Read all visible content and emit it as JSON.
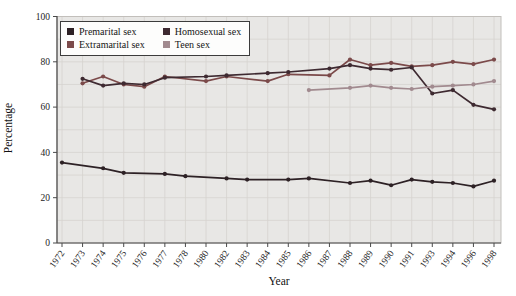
{
  "chart_data": {
    "type": "line",
    "title": "",
    "xlabel": "Year",
    "ylabel": "Percentage",
    "ylim": [
      0,
      100
    ],
    "yticks": [
      0,
      20,
      40,
      60,
      80,
      100
    ],
    "grid": true,
    "legend_position": "top-left",
    "legend_order": [
      0,
      2,
      1,
      3
    ],
    "categories": [
      "1972",
      "1973",
      "1974",
      "1975",
      "1976",
      "1977",
      "1978",
      "1980",
      "1982",
      "1983",
      "1984",
      "1985",
      "1986",
      "1987",
      "1988",
      "1989",
      "1990",
      "1991",
      "1993",
      "1994",
      "1996",
      "1998"
    ],
    "series": [
      {
        "name": "Premarital sex",
        "color": "#2d2125",
        "values": [
          35.5,
          null,
          33,
          31,
          null,
          30.5,
          29.5,
          null,
          28.5,
          28,
          null,
          28,
          28.5,
          null,
          26.5,
          27.5,
          25.5,
          28,
          27,
          26.5,
          25,
          27.5
        ]
      },
      {
        "name": "Extramarital sex",
        "color": "#7b4a4a",
        "values": [
          null,
          70.5,
          73.5,
          70,
          69,
          73.5,
          null,
          71.5,
          73.5,
          null,
          71.5,
          74.5,
          null,
          74,
          81,
          78.5,
          79.5,
          78,
          78.5,
          80,
          79,
          81
        ]
      },
      {
        "name": "Homosexual sex",
        "color": "#3e2a31",
        "values": [
          null,
          72.5,
          69.5,
          70.5,
          70,
          73,
          null,
          73.5,
          74,
          null,
          75,
          75.5,
          null,
          77,
          78.5,
          77,
          76.5,
          77.5,
          66,
          67.5,
          61,
          59
        ]
      },
      {
        "name": "Teen sex",
        "color": "#a18a8f",
        "values": [
          null,
          null,
          null,
          null,
          null,
          null,
          null,
          null,
          null,
          null,
          null,
          null,
          67.5,
          null,
          68.5,
          69.5,
          68.5,
          68,
          69,
          69.5,
          70,
          71.5
        ]
      }
    ],
    "colors": {
      "plot_bg": "#e8e7e5",
      "grid": "#d5d3cf",
      "frame": "#c2bfbb",
      "axis": "#4a4a4a",
      "text": "#1c1c1c"
    }
  }
}
